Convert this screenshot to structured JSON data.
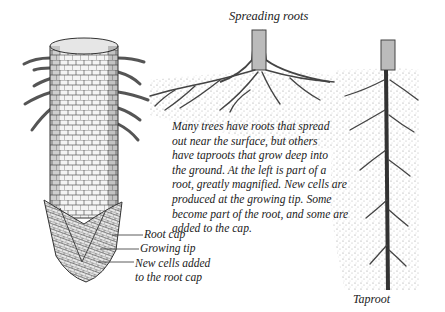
{
  "figure": {
    "panels": [
      {
        "id": "magnified-root",
        "description": "Magnified root section with root hairs, cell pattern and root cap"
      },
      {
        "id": "spreading-roots",
        "title": "Spreading roots"
      },
      {
        "id": "taproot",
        "title": "Taproot"
      }
    ],
    "titles": {
      "spreading": "Spreading roots",
      "taproot": "Taproot"
    },
    "caption_lines": [
      "Many trees have roots that spread",
      "out near the surface, but others",
      "have taproots that grow deep into",
      "the ground. At the left is part of a",
      "root, greatly magnified. New cells are",
      "produced at the growing tip. Some",
      "become part of the root, and some are",
      "added to the cap."
    ],
    "callouts": {
      "root_cap": "Root cap",
      "growing_tip": "Growing tip",
      "new_cells_line1": "New cells added",
      "new_cells_line2": "to the root cap"
    },
    "colors": {
      "ink": "#222222",
      "background": "#ffffff",
      "soil": "#9a9a9a"
    }
  }
}
